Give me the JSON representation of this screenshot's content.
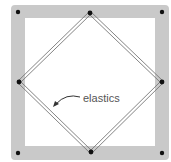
{
  "diagram": {
    "label": "elastics",
    "colors": {
      "frame": "#c9c9c9",
      "pin": "#111111",
      "elastic": "#777777",
      "text": "#555555"
    }
  }
}
